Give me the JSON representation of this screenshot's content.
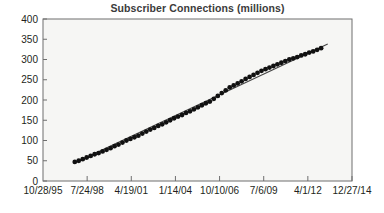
{
  "chart_data": {
    "type": "scatter",
    "title": "Subscriber Connections (millions)",
    "xlabel": "",
    "ylabel": "",
    "grid": false,
    "legend": null,
    "ylim": [
      0,
      400
    ],
    "ytick_labels": [
      "0",
      "50",
      "100",
      "150",
      "200",
      "250",
      "300",
      "350",
      "400"
    ],
    "ytick_values": [
      0,
      50,
      100,
      150,
      200,
      250,
      300,
      350,
      400
    ],
    "xtick_labels": [
      "10/28/95",
      "7/24/98",
      "4/19/01",
      "1/14/04",
      "10/10/06",
      "7/6/09",
      "4/1/12",
      "12/27/14"
    ],
    "xtick_values": [
      0,
      1000,
      2000,
      3000,
      4000,
      5000,
      6000,
      7000
    ],
    "xlim": [
      0,
      7000
    ],
    "series": [
      {
        "name": "Subscriber Connections",
        "marker": "filled-circle",
        "color": "#111111",
        "x": [
          720,
          810,
          900,
          990,
          1080,
          1170,
          1260,
          1350,
          1440,
          1530,
          1620,
          1710,
          1800,
          1890,
          1980,
          2070,
          2160,
          2250,
          2340,
          2430,
          2520,
          2610,
          2700,
          2790,
          2880,
          2970,
          3060,
          3150,
          3240,
          3330,
          3420,
          3510,
          3600,
          3690,
          3780,
          3870,
          3960,
          4050,
          4140,
          4230,
          4320,
          4410,
          4500,
          4590,
          4680,
          4770,
          4860,
          4950,
          5040,
          5130,
          5220,
          5310,
          5400,
          5490,
          5580,
          5670,
          5760,
          5850,
          5940,
          6030,
          6120,
          6210,
          6300
        ],
        "y": [
          47,
          50,
          54,
          58,
          62,
          66,
          69,
          73,
          77,
          81,
          86,
          90,
          95,
          100,
          104,
          108,
          112,
          117,
          122,
          127,
          131,
          136,
          140,
          145,
          150,
          155,
          159,
          163,
          168,
          172,
          177,
          182,
          187,
          192,
          196,
          203,
          210,
          217,
          224,
          231,
          236,
          241,
          246,
          252,
          257,
          262,
          267,
          272,
          276,
          280,
          284,
          288,
          292,
          296,
          300,
          303,
          306,
          310,
          313,
          317,
          320,
          324,
          328
        ]
      }
    ],
    "trendline": {
      "name": "Linear trend",
      "color": "#444444",
      "x": [
        700,
        6450
      ],
      "y": [
        44,
        338
      ]
    }
  }
}
